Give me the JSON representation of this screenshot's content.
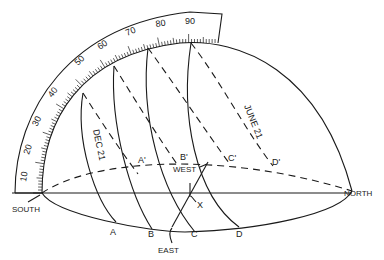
{
  "figure": {
    "type": "sun-path hemisphere diagram",
    "scale": {
      "labels": [
        "10",
        "20",
        "30",
        "40",
        "50",
        "60",
        "70",
        "80",
        "90"
      ]
    },
    "directions": {
      "south": "SOUTH",
      "north": "NORTH",
      "east": "EAST",
      "west": "WEST"
    },
    "curves": {
      "dec": "DEC 21",
      "june": "JUNE 21"
    },
    "points": {
      "a": "A",
      "b": "B",
      "c": "C",
      "d": "D",
      "a_prime": "A'",
      "b_prime": "B'",
      "c_prime": "C'",
      "d_prime": "D'",
      "x": "X"
    },
    "colors": {
      "ink": "#1a1a1a",
      "background": "#ffffff"
    }
  }
}
